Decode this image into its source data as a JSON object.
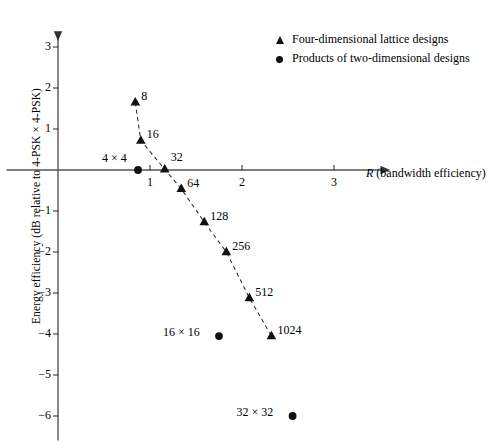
{
  "chart_data": {
    "type": "scatter",
    "title": "",
    "xlabel": "R (bandwidth efficiency)",
    "xlabel_symbol": "R",
    "xlabel_rest": "(bandwidth efficiency)",
    "ylabel": "Energy efficiency (dB relative to 4-PSK × 4-PSK)",
    "xlim": [
      0,
      3.6
    ],
    "ylim": [
      -6.6,
      3.6
    ],
    "xticks": [
      1,
      2,
      3
    ],
    "xtick_labels": [
      "1",
      "2",
      "3"
    ],
    "yticks": [
      3,
      2,
      1,
      -1,
      -2,
      -3,
      -4,
      -5,
      -6
    ],
    "ytick_labels": [
      "3",
      "2",
      "1",
      "−1",
      "−2",
      "−3",
      "−4",
      "−5",
      "−6"
    ],
    "grid": false,
    "axis_style": "arrowed-spines-through-origin",
    "legend_position": "top-right",
    "series": [
      {
        "name": "Four-dimensional lattice designs",
        "marker": "triangle",
        "connected": true,
        "line_style": "dashed",
        "points": [
          {
            "label": "8",
            "x": 0.84,
            "y": 1.65,
            "label_pos": "right"
          },
          {
            "label": "16",
            "x": 0.9,
            "y": 0.72,
            "label_pos": "right"
          },
          {
            "label": "32",
            "x": 1.16,
            "y": 0.02,
            "label_pos": "upper-right"
          },
          {
            "label": "64",
            "x": 1.34,
            "y": -0.46,
            "label_pos": "right"
          },
          {
            "label": "128",
            "x": 1.59,
            "y": -1.27,
            "label_pos": "right"
          },
          {
            "label": "256",
            "x": 1.83,
            "y": -2.0,
            "label_pos": "right"
          },
          {
            "label": "512",
            "x": 2.08,
            "y": -3.12,
            "label_pos": "right"
          },
          {
            "label": "1024",
            "x": 2.32,
            "y": -4.05,
            "label_pos": "right"
          }
        ]
      },
      {
        "name": "Products of two-dimensional designs",
        "marker": "circle",
        "connected": false,
        "points": [
          {
            "label": "4 × 4",
            "x": 0.87,
            "y": 0.0,
            "label_pos": "upper-left"
          },
          {
            "label": "16 × 16",
            "x": 1.75,
            "y": -4.05,
            "label_pos": "left"
          },
          {
            "label": "32 × 32",
            "x": 2.55,
            "y": -6.0,
            "label_pos": "left"
          }
        ]
      }
    ]
  },
  "legend": {
    "items": [
      {
        "marker": "triangle",
        "label": "Four-dimensional lattice designs"
      },
      {
        "marker": "circle",
        "label": "Products of two-dimensional designs"
      }
    ]
  }
}
